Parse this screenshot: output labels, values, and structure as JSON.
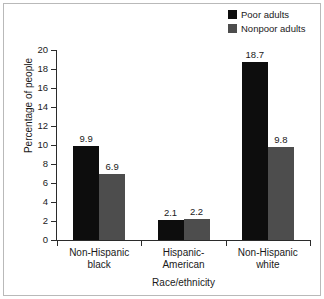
{
  "chart_data": {
    "type": "bar",
    "title": "",
    "xlabel": "Race/ethnicity",
    "ylabel": "Percentage of people",
    "categories": [
      "Non-Hispanic black",
      "Hispanic-American",
      "Non-Hispanic white"
    ],
    "category_lines": [
      [
        "Non-Hispanic",
        "black"
      ],
      [
        "Hispanic-",
        "American"
      ],
      [
        "Non-Hispanic",
        "white"
      ]
    ],
    "series": [
      {
        "name": "Poor adults",
        "color": "#0d0d0d",
        "values": [
          9.9,
          2.1,
          18.7
        ],
        "value_labels": [
          "9.9",
          "2.1",
          "18.7"
        ]
      },
      {
        "name": "Nonpoor adults",
        "color": "#4d4d4d",
        "values": [
          6.9,
          2.2,
          9.8
        ],
        "value_labels": [
          "6.9",
          "2.2",
          "9.8"
        ]
      }
    ],
    "ylim": [
      0,
      20
    ],
    "ytick_labels": [
      "0",
      "2",
      "4",
      "6",
      "8",
      "10",
      "12",
      "14",
      "16",
      "18",
      "20"
    ],
    "ytick_values": [
      0,
      2,
      4,
      6,
      8,
      10,
      12,
      14,
      16,
      18,
      20
    ],
    "grid": false,
    "legend_position": "top-right"
  },
  "legend": {
    "items": [
      {
        "label": "Poor adults",
        "color": "#0d0d0d"
      },
      {
        "label": "Nonpoor adults",
        "color": "#4d4d4d"
      }
    ]
  },
  "axes": {
    "y_title": "Percentage of people",
    "x_title": "Race/ethnicity"
  }
}
